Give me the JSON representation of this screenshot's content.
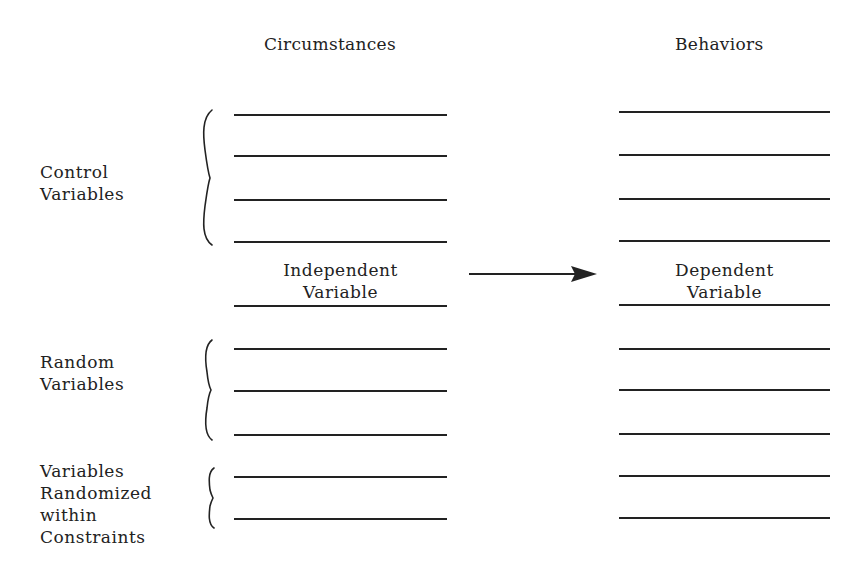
{
  "headers": {
    "left": "Circumstances",
    "right": "Behaviors"
  },
  "groups": {
    "control": "Control\nVariables",
    "random": "Random\nVariables",
    "constrained": "Variables\nRandomized\nwithin\nConstraints"
  },
  "independent": "Independent\nVariable",
  "dependent": "Dependent\nVariable",
  "arrow": {
    "from": "independent",
    "to": "dependent"
  },
  "left_lines_y": [
    115,
    156,
    200,
    242,
    306,
    349,
    391,
    435,
    477,
    519
  ],
  "right_lines_y": [
    112,
    155,
    199,
    241,
    305,
    349,
    390,
    434,
    476,
    518
  ]
}
